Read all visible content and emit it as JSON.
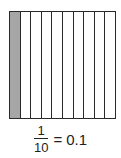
{
  "diagram": {
    "total_parts": 10,
    "shaded_parts": 1,
    "shaded_color": "#a6a6a6",
    "line_color": "#2a2a2a"
  },
  "caption": {
    "numerator": "1",
    "denominator": "10",
    "equals": "=",
    "decimal": "0.1"
  }
}
